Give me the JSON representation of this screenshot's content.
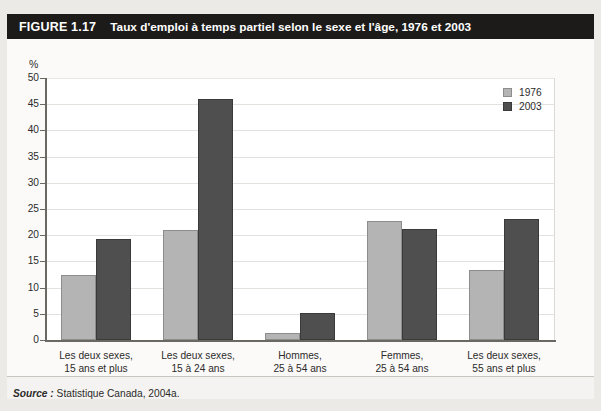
{
  "figure": {
    "number": "FIGURE 1.17",
    "title": "Taux d'emploi à temps partiel selon le sexe et l'âge, 1976 et 2003"
  },
  "source": {
    "label": "Source :",
    "text": "Statistique Canada, 2004a."
  },
  "chart_data": {
    "type": "bar",
    "title": "Taux d'emploi à temps partiel selon le sexe et l'âge, 1976 et 2003",
    "xlabel": "",
    "ylabel": "%",
    "ylim": [
      0,
      50
    ],
    "yticks": [
      0,
      5,
      10,
      15,
      20,
      25,
      30,
      35,
      40,
      45,
      50
    ],
    "grid": true,
    "legend_position": "top-right",
    "categories": [
      "Les deux sexes,\n15 ans et plus",
      "Les deux sexes,\n15 à 24 ans",
      "Hommes,\n25 à 54 ans",
      "Femmes,\n25 à 54 ans",
      "Les deux sexes,\n55 ans et plus"
    ],
    "category_lines": [
      [
        "Les deux sexes,",
        "15 ans et plus"
      ],
      [
        "Les deux sexes,",
        "15 à 24 ans"
      ],
      [
        "Hommes,",
        "25 à 54 ans"
      ],
      [
        "Femmes,",
        "25 à 54 ans"
      ],
      [
        "Les deux sexes,",
        "55 ans et plus"
      ]
    ],
    "series": [
      {
        "name": "1976",
        "color": "#b4b4b4",
        "values": [
          12.5,
          21.0,
          1.3,
          22.7,
          13.4
        ]
      },
      {
        "name": "2003",
        "color": "#4f4f4f",
        "values": [
          19.2,
          46.0,
          5.2,
          21.1,
          23.0
        ]
      }
    ]
  }
}
